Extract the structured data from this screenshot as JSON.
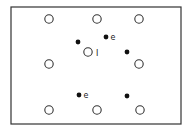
{
  "diagram": {
    "frame": {
      "x": 11,
      "y": 7,
      "w": 170,
      "h": 117,
      "stroke": "#333333"
    },
    "open_circles": [
      {
        "x": 49,
        "y": 19
      },
      {
        "x": 97,
        "y": 19
      },
      {
        "x": 139,
        "y": 19
      },
      {
        "x": 49,
        "y": 64
      },
      {
        "x": 139,
        "y": 64
      },
      {
        "x": 49,
        "y": 110
      },
      {
        "x": 97,
        "y": 110
      },
      {
        "x": 140,
        "y": 110
      },
      {
        "x": 88,
        "y": 52,
        "label": "I"
      }
    ],
    "filled_dots": [
      {
        "x": 78,
        "y": 42
      },
      {
        "x": 106,
        "y": 37,
        "label": "e"
      },
      {
        "x": 127,
        "y": 52
      },
      {
        "x": 79,
        "y": 95,
        "label": "e"
      },
      {
        "x": 127,
        "y": 96
      }
    ],
    "labels": {
      "center_circle": "I",
      "top_dot": "e",
      "lower_left_dot": "e"
    },
    "colors": {
      "line": "#333333",
      "fill": "#111111",
      "background": "#ffffff"
    }
  }
}
